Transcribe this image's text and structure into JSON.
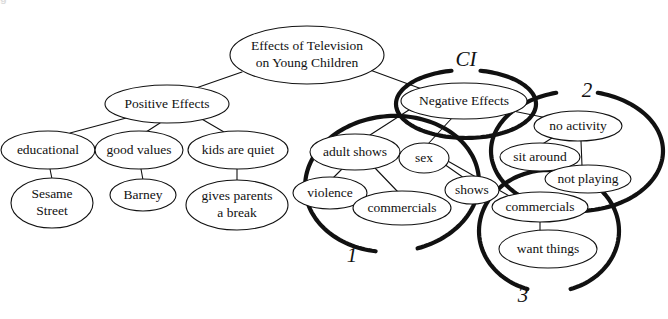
{
  "figure": {
    "type": "concept-map",
    "title_fragment_top": "g",
    "background": "#ffffff",
    "ink_color": "#111111"
  },
  "nodes": [
    {
      "id": "root",
      "label_line1": "Effects of Television",
      "label_line2": "on Young Children",
      "cx": 307,
      "cy": 55,
      "rx": 77,
      "ry": 29,
      "fontsize": 13.5,
      "stroke": 1.1
    },
    {
      "id": "positive",
      "label_line1": "Positive Effects",
      "label_line2": "",
      "cx": 167,
      "cy": 104,
      "rx": 62,
      "ry": 19,
      "fontsize": 13.5,
      "stroke": 1.1
    },
    {
      "id": "educational",
      "label_line1": "educational",
      "label_line2": "",
      "cx": 48,
      "cy": 150,
      "rx": 47,
      "ry": 19,
      "fontsize": 13.5,
      "stroke": 1.1
    },
    {
      "id": "goodvalues",
      "label_line1": "good values",
      "label_line2": "",
      "cx": 139,
      "cy": 150,
      "rx": 44,
      "ry": 19,
      "fontsize": 13.5,
      "stroke": 1.1
    },
    {
      "id": "kidsquiet",
      "label_line1": "kids are quiet",
      "label_line2": "",
      "cx": 238,
      "cy": 150,
      "rx": 50,
      "ry": 19,
      "fontsize": 13.5,
      "stroke": 1.1
    },
    {
      "id": "sesame",
      "label_line1": "Sesame",
      "label_line2": "Street",
      "cx": 52,
      "cy": 203,
      "rx": 41,
      "ry": 25,
      "fontsize": 13.5,
      "stroke": 1.1
    },
    {
      "id": "barney",
      "label_line1": "Barney",
      "label_line2": "",
      "cx": 143,
      "cy": 195,
      "rx": 33,
      "ry": 16,
      "fontsize": 13.5,
      "stroke": 1.1
    },
    {
      "id": "givesparents",
      "label_line1": "gives parents",
      "label_line2": "a break",
      "cx": 237,
      "cy": 205,
      "rx": 51,
      "ry": 25,
      "fontsize": 13.5,
      "stroke": 1.1
    },
    {
      "id": "negative",
      "label_line1": "Negative Effects",
      "label_line2": "",
      "cx": 464,
      "cy": 101,
      "rx": 63,
      "ry": 18,
      "fontsize": 13.5,
      "stroke": 1.1
    },
    {
      "id": "adultshows",
      "label_line1": "adult shows",
      "label_line2": "",
      "cx": 355,
      "cy": 152,
      "rx": 45,
      "ry": 18,
      "fontsize": 13.5,
      "stroke": 1.1
    },
    {
      "id": "sex",
      "label_line1": "sex",
      "label_line2": "",
      "cx": 424,
      "cy": 158,
      "rx": 25,
      "ry": 15,
      "fontsize": 13.5,
      "stroke": 1.1
    },
    {
      "id": "violence",
      "label_line1": "violence",
      "label_line2": "",
      "cx": 330,
      "cy": 193,
      "rx": 37,
      "ry": 16,
      "fontsize": 13.5,
      "stroke": 1.1
    },
    {
      "id": "commercials1",
      "label_line1": "commercials",
      "label_line2": "",
      "cx": 402,
      "cy": 208,
      "rx": 49,
      "ry": 17,
      "fontsize": 13.5,
      "stroke": 1.1
    },
    {
      "id": "shows",
      "label_line1": "shows",
      "label_line2": "",
      "cx": 472,
      "cy": 190,
      "rx": 27,
      "ry": 14,
      "fontsize": 13.5,
      "stroke": 1.1
    },
    {
      "id": "noactivity",
      "label_line1": "no activity",
      "label_line2": "",
      "cx": 578,
      "cy": 126,
      "rx": 44,
      "ry": 15,
      "fontsize": 13.5,
      "stroke": 1.1
    },
    {
      "id": "sitaround",
      "label_line1": "sit around",
      "label_line2": "",
      "cx": 540,
      "cy": 157,
      "rx": 40,
      "ry": 14,
      "fontsize": 13.5,
      "stroke": 1.1
    },
    {
      "id": "notplaying",
      "label_line1": "not playing",
      "label_line2": "",
      "cx": 588,
      "cy": 179,
      "rx": 43,
      "ry": 14,
      "fontsize": 13.5,
      "stroke": 1.1
    },
    {
      "id": "commercials2",
      "label_line1": "commercials",
      "label_line2": "",
      "cx": 540,
      "cy": 207,
      "rx": 48,
      "ry": 15,
      "fontsize": 13.5,
      "stroke": 1.1
    },
    {
      "id": "wantthings",
      "label_line1": "want things",
      "label_line2": "",
      "cx": 548,
      "cy": 249,
      "rx": 49,
      "ry": 19,
      "fontsize": 13.5,
      "stroke": 1.1
    }
  ],
  "edges": [
    {
      "from": "root",
      "to": "positive",
      "x1": 242,
      "y1": 72,
      "x2": 196,
      "y2": 88
    },
    {
      "from": "root",
      "to": "negative",
      "x1": 370,
      "y1": 70,
      "x2": 430,
      "y2": 92
    },
    {
      "from": "positive",
      "to": "educational",
      "x1": 130,
      "y1": 117,
      "x2": 70,
      "y2": 133
    },
    {
      "from": "positive",
      "to": "goodvalues",
      "x1": 160,
      "y1": 123,
      "x2": 146,
      "y2": 132
    },
    {
      "from": "positive",
      "to": "kidsquiet",
      "x1": 200,
      "y1": 118,
      "x2": 224,
      "y2": 132
    },
    {
      "from": "educational",
      "to": "sesame",
      "x1": 50,
      "y1": 169,
      "x2": 52,
      "y2": 179
    },
    {
      "from": "goodvalues",
      "to": "barney",
      "x1": 141,
      "y1": 169,
      "x2": 143,
      "y2": 180
    },
    {
      "from": "kidsquiet",
      "to": "givesparents",
      "x1": 237,
      "y1": 169,
      "x2": 237,
      "y2": 181
    },
    {
      "from": "negative",
      "to": "adultshows",
      "x1": 412,
      "y1": 108,
      "x2": 370,
      "y2": 135
    },
    {
      "from": "negative",
      "to": "sex",
      "x1": 452,
      "y1": 118,
      "x2": 428,
      "y2": 144
    },
    {
      "from": "negative",
      "to": "noactivity",
      "x1": 508,
      "y1": 110,
      "x2": 552,
      "y2": 119
    },
    {
      "from": "adultshows",
      "to": "violence",
      "x1": 343,
      "y1": 168,
      "x2": 333,
      "y2": 178
    },
    {
      "from": "adultshows",
      "to": "commercials1",
      "x1": 375,
      "y1": 168,
      "x2": 398,
      "y2": 192
    },
    {
      "from": "sex",
      "to": "shows",
      "x1": 444,
      "y1": 164,
      "x2": 464,
      "y2": 178
    },
    {
      "from": "sex",
      "to": "commercials2",
      "x1": 446,
      "y1": 160,
      "x2": 513,
      "y2": 198
    },
    {
      "from": "noactivity",
      "to": "sitaround",
      "x1": 552,
      "y1": 138,
      "x2": 541,
      "y2": 145
    },
    {
      "from": "noactivity",
      "to": "notplaying",
      "x1": 581,
      "y1": 141,
      "x2": 582,
      "y2": 166
    },
    {
      "from": "commercials2",
      "to": "wantthings",
      "x1": 540,
      "y1": 222,
      "x2": 540,
      "y2": 231
    }
  ],
  "groupings": [
    {
      "id": "group-1",
      "label": "1",
      "label_x": 352,
      "label_y": 262,
      "label_size": 21,
      "ellipse": {
        "cx": 392,
        "cy": 184,
        "rx": 87,
        "ry": 68,
        "rotation": -4
      },
      "gap_start_deg": 76,
      "gap_end_deg": 104,
      "stroke": 4.2
    },
    {
      "id": "group-2",
      "label": "2",
      "label_x": 587,
      "label_y": 97,
      "label_size": 21,
      "ellipse": {
        "cx": 577,
        "cy": 151,
        "rx": 86,
        "ry": 60,
        "rotation": 0
      },
      "gap_start_deg": -104,
      "gap_end_deg": -76,
      "stroke": 4.2
    },
    {
      "id": "group-3",
      "label": "3",
      "label_x": 523,
      "label_y": 302,
      "label_size": 21,
      "ellipse": {
        "cx": 549,
        "cy": 231,
        "rx": 70,
        "ry": 61,
        "rotation": 0
      },
      "gap_start_deg": 72,
      "gap_end_deg": 108,
      "stroke": 4.2
    },
    {
      "id": "group-ci",
      "label": "CI",
      "label_x": 466,
      "label_y": 66,
      "label_size": 21,
      "ellipse": {
        "cx": 466,
        "cy": 104,
        "rx": 70,
        "ry": 34,
        "rotation": 0
      },
      "gap_start_deg": -102,
      "gap_end_deg": -78,
      "stroke": 4.2
    }
  ]
}
